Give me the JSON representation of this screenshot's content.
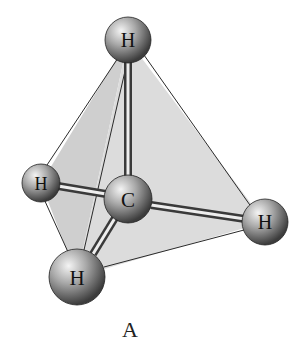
{
  "diagram": {
    "caption": "A",
    "atoms": [
      {
        "id": "h_top",
        "symbol": "H",
        "x": 128,
        "y": 40,
        "r": 23
      },
      {
        "id": "h_left",
        "symbol": "H",
        "x": 41,
        "y": 183,
        "r": 19
      },
      {
        "id": "c_center",
        "symbol": "C",
        "x": 128,
        "y": 199,
        "r": 24
      },
      {
        "id": "h_right",
        "symbol": "H",
        "x": 265,
        "y": 222,
        "r": 23
      },
      {
        "id": "h_bottom",
        "symbol": "H",
        "x": 77,
        "y": 277,
        "r": 28
      }
    ],
    "bonds": [
      {
        "from": "c_center",
        "to": "h_top"
      },
      {
        "from": "c_center",
        "to": "h_left"
      },
      {
        "from": "c_center",
        "to": "h_right"
      },
      {
        "from": "c_center",
        "to": "h_bottom"
      }
    ],
    "colors": {
      "face": "#d4d4d4",
      "edge": "#2a2a2a",
      "atom_dark": "#3a3a3a",
      "atom_light": "#e8e8e8"
    }
  }
}
